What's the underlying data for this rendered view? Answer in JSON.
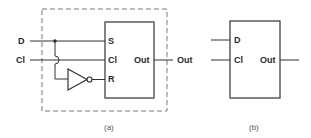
{
  "figure_a": {
    "caption": "(a)",
    "inputs": {
      "d": "D",
      "cl": "Cl"
    },
    "output": "Out",
    "latch": {
      "s": "S",
      "cl": "Cl",
      "r": "R",
      "out": "Out"
    }
  },
  "figure_b": {
    "caption": "(b)",
    "pins": {
      "d": "D",
      "cl": "Cl",
      "out": "Out"
    }
  },
  "colors": {
    "line": "#333333",
    "dashed_border": "#777777",
    "background": "#ffffff"
  }
}
